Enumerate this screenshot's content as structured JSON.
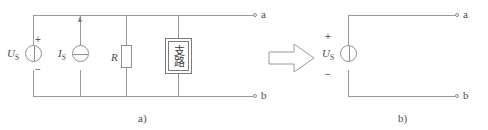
{
  "figure": {
    "background_color": "#ffffff",
    "line_color": "#9a9a9a",
    "text_color": "#4a4a4a"
  },
  "left_circuit": {
    "caption": "a)",
    "voltage_source": {
      "label": "U",
      "label_sub": "S",
      "plus_sign": "+",
      "minus_sign": "−",
      "symbol": "voltage-source-circle"
    },
    "current_source": {
      "label": "I",
      "label_sub": "S",
      "symbol": "current-source-circle",
      "arrow_direction": "up"
    },
    "resistor": {
      "label": "R",
      "symbol": "resistor-rectangle"
    },
    "branch_box": {
      "text": "支路",
      "symbol": "branch-box"
    },
    "terminals": {
      "top": "a",
      "bottom": "b"
    }
  },
  "transform_arrow": {
    "symbol": "block-arrow-right",
    "direction": "right"
  },
  "right_circuit": {
    "caption": "b)",
    "voltage_source": {
      "label": "U",
      "label_sub": "S",
      "plus_sign": "+",
      "minus_sign": "−",
      "symbol": "voltage-source-circle"
    },
    "terminals": {
      "top": "a",
      "bottom": "b"
    }
  }
}
